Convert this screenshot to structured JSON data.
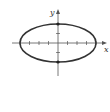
{
  "diagram": {
    "type": "ellipse-graph",
    "axes": {
      "x_label": "x",
      "y_label": "y"
    },
    "ellipse": {
      "center": [
        0,
        0
      ],
      "semi_major_x": 4,
      "semi_minor_y": 2
    },
    "x_ticks": [
      -4,
      -3,
      -2,
      -1,
      1,
      2,
      3,
      4
    ],
    "y_ticks": [
      -2,
      -1,
      1,
      2
    ],
    "marked_points": [
      [
        0,
        2
      ],
      [
        0,
        -2
      ],
      [
        -4,
        0
      ],
      [
        4,
        0
      ]
    ],
    "colors": {
      "curve": "#333333",
      "axis": "#555555",
      "points": "#222222"
    }
  }
}
